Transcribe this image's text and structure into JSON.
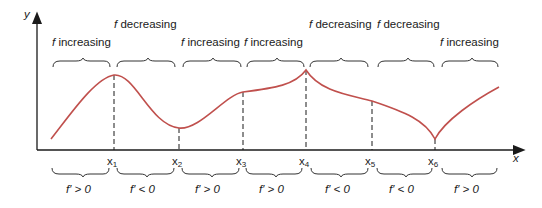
{
  "diagram": {
    "axes": {
      "x_label": "x",
      "y_label": "y"
    },
    "x_ticks": [
      {
        "base": "x",
        "sub": "1"
      },
      {
        "base": "x",
        "sub": "2"
      },
      {
        "base": "x",
        "sub": "3"
      },
      {
        "base": "x",
        "sub": "4"
      },
      {
        "base": "x",
        "sub": "5"
      },
      {
        "base": "x",
        "sub": "6"
      }
    ],
    "top_labels": [
      {
        "f": "f",
        "text": " increasing"
      },
      {
        "f": "f",
        "text": " decreasing"
      },
      {
        "f": "f",
        "text": " increasing"
      },
      {
        "f": "f",
        "text": " increasing"
      },
      {
        "f": "f",
        "text": " decreasing"
      },
      {
        "f": "f",
        "text": " decreasing"
      },
      {
        "f": "f",
        "text": " increasing"
      }
    ],
    "bottom_labels": [
      "f′ > 0",
      "f′ < 0",
      "f′ > 0",
      "f′ > 0",
      "f′ < 0",
      "f′ < 0",
      "f′ > 0"
    ],
    "colors": {
      "curve": "#c0504d",
      "axis": "#1a1a1a"
    }
  }
}
